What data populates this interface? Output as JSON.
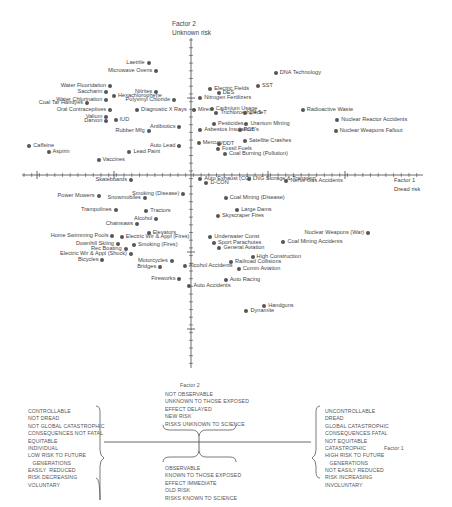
{
  "chart_data": {
    "type": "scatter",
    "title": "",
    "xlabel": "Factor 1 Dread risk",
    "ylabel": "Factor 2 Unknown risk",
    "grid": false,
    "axis_ranges": {
      "x": [
        -2.5,
        2.5
      ],
      "y": [
        -2.3,
        2.1
      ]
    },
    "legend_position": "bottom",
    "points": [
      {
        "label": "Laetrile",
        "x": -0.55,
        "y": 1.45,
        "side": "left"
      },
      {
        "label": "Microwave Ovens",
        "x": -0.45,
        "y": 1.35,
        "side": "left"
      },
      {
        "label": "Water Fluoridation",
        "x": -1.05,
        "y": 1.15,
        "side": "left"
      },
      {
        "label": "Saccharin",
        "x": -1.1,
        "y": 1.08,
        "side": "left"
      },
      {
        "label": "Water Chlorination",
        "x": -1.1,
        "y": 0.98,
        "side": "left"
      },
      {
        "label": "Coal Tar Hairdyes",
        "x": -1.35,
        "y": 0.93,
        "side": "left"
      },
      {
        "label": "Nitrites",
        "x": -0.45,
        "y": 1.08,
        "side": "left"
      },
      {
        "label": "Hexachlorophene",
        "x": -1.0,
        "y": 1.02,
        "side": "right"
      },
      {
        "label": "Polyvinyl Chloride",
        "x": -0.22,
        "y": 0.98,
        "side": "left"
      },
      {
        "label": "Oral Contraceptives",
        "x": -1.05,
        "y": 0.85,
        "side": "left"
      },
      {
        "label": "Diagnostic X Rays",
        "x": -0.7,
        "y": 0.85,
        "side": "right"
      },
      {
        "label": "Valium",
        "x": -1.1,
        "y": 0.75,
        "side": "left"
      },
      {
        "label": "Darvon",
        "x": -1.1,
        "y": 0.7,
        "side": "left"
      },
      {
        "label": "IUD",
        "x": -0.98,
        "y": 0.72,
        "side": "right"
      },
      {
        "label": "Antibiotics",
        "x": -0.15,
        "y": 0.62,
        "side": "left"
      },
      {
        "label": "Rubber Mfg",
        "x": -0.55,
        "y": 0.57,
        "side": "left"
      },
      {
        "label": "Caffeine",
        "x": -2.1,
        "y": 0.38,
        "side": "right"
      },
      {
        "label": "Aspirin",
        "x": -1.85,
        "y": 0.3,
        "side": "right"
      },
      {
        "label": "Auto Lead",
        "x": -0.15,
        "y": 0.38,
        "side": "left"
      },
      {
        "label": "Lead Paint",
        "x": -0.8,
        "y": 0.3,
        "side": "right"
      },
      {
        "label": "Vaccines",
        "x": -1.2,
        "y": 0.2,
        "side": "right"
      },
      {
        "label": "Mirex",
        "x": 0.04,
        "y": 0.84,
        "side": "right"
      },
      {
        "label": "Electric Fields",
        "x": 0.25,
        "y": 1.12,
        "side": "right"
      },
      {
        "label": "DES",
        "x": 0.36,
        "y": 1.06,
        "side": "right"
      },
      {
        "label": "Nitrogen Fertilizers",
        "x": 0.12,
        "y": 1.0,
        "side": "right"
      },
      {
        "label": "Cadmium Usage",
        "x": 0.27,
        "y": 0.86,
        "side": "right"
      },
      {
        "label": "Trichloroethylene",
        "x": 0.33,
        "y": 0.81,
        "side": "right"
      },
      {
        "label": "2,4,5-T",
        "x": 0.7,
        "y": 0.8,
        "side": "right"
      },
      {
        "label": "DNA Technology",
        "x": 1.1,
        "y": 1.33,
        "side": "right"
      },
      {
        "label": "SST",
        "x": 0.87,
        "y": 1.16,
        "side": "right"
      },
      {
        "label": "Radioactive Waste",
        "x": 1.45,
        "y": 0.85,
        "side": "right"
      },
      {
        "label": "Pesticides",
        "x": 0.3,
        "y": 0.66,
        "side": "right"
      },
      {
        "label": "Uranium Mining",
        "x": 0.72,
        "y": 0.66,
        "side": "right"
      },
      {
        "label": "Asbestos Insulation",
        "x": 0.12,
        "y": 0.58,
        "side": "right"
      },
      {
        "label": "PCB's",
        "x": 0.63,
        "y": 0.58,
        "side": "right"
      },
      {
        "label": "Nuclear Reactor Accidents",
        "x": 1.9,
        "y": 0.72,
        "side": "right"
      },
      {
        "label": "Nuclear Weapons Fallout",
        "x": 1.88,
        "y": 0.57,
        "side": "right"
      },
      {
        "label": "Satellite Crashes",
        "x": 0.7,
        "y": 0.44,
        "side": "right"
      },
      {
        "label": "Mercury",
        "x": 0.1,
        "y": 0.42,
        "side": "right"
      },
      {
        "label": "DDT",
        "x": 0.36,
        "y": 0.4,
        "side": "right"
      },
      {
        "label": "Fossil Fuels",
        "x": 0.35,
        "y": 0.34,
        "side": "right"
      },
      {
        "label": "Coal Burning (Pollution)",
        "x": 0.44,
        "y": 0.27,
        "side": "right"
      },
      {
        "label": "Skateboards",
        "x": -0.78,
        "y": -0.07,
        "side": "left"
      },
      {
        "label": "Power Mowers",
        "x": -1.2,
        "y": -0.27,
        "side": "left"
      },
      {
        "label": "Snowmobiles",
        "x": -0.6,
        "y": -0.3,
        "side": "left"
      },
      {
        "label": "Smoking (Disease)",
        "x": -0.1,
        "y": -0.25,
        "side": "left"
      },
      {
        "label": "Trampolines",
        "x": -0.98,
        "y": -0.45,
        "side": "left"
      },
      {
        "label": "Tractors",
        "x": -0.58,
        "y": -0.47,
        "side": "right"
      },
      {
        "label": "Alcohol",
        "x": -0.45,
        "y": -0.57,
        "side": "left"
      },
      {
        "label": "Chainsaws",
        "x": -0.7,
        "y": -0.63,
        "side": "left"
      },
      {
        "label": "Elevators",
        "x": -0.55,
        "y": -0.75,
        "side": "right"
      },
      {
        "label": "Home Swimming Pools",
        "x": -1.02,
        "y": -0.79,
        "side": "left"
      },
      {
        "label": "Electric Wir & Appl (Fires)",
        "x": -0.9,
        "y": -0.81,
        "side": "right"
      },
      {
        "label": "Downhill Skiing",
        "x": -0.95,
        "y": -0.89,
        "side": "left"
      },
      {
        "label": "Smoking (Fires)",
        "x": -0.74,
        "y": -0.91,
        "side": "right"
      },
      {
        "label": "Rec Boating",
        "x": -0.85,
        "y": -0.96,
        "side": "left"
      },
      {
        "label": "Electric Wir & Appl (Shock)",
        "x": -0.78,
        "y": -1.03,
        "side": "left"
      },
      {
        "label": "Bicycles",
        "x": -1.15,
        "y": -1.11,
        "side": "left"
      },
      {
        "label": "Motorcycles",
        "x": -0.25,
        "y": -1.12,
        "side": "left"
      },
      {
        "label": "Bridges",
        "x": -0.4,
        "y": -1.2,
        "side": "left"
      },
      {
        "label": "Fireworks",
        "x": -0.15,
        "y": -1.35,
        "side": "left"
      },
      {
        "label": "Auto Exhaust (CO)",
        "x": 0.12,
        "y": -0.05,
        "side": "right"
      },
      {
        "label": "D-CON",
        "x": 0.2,
        "y": -0.1,
        "side": "right"
      },
      {
        "label": "LNG Storage & Transport",
        "x": 0.75,
        "y": -0.05,
        "side": "right"
      },
      {
        "label": "Nerve Gas Accidents",
        "x": 1.24,
        "y": -0.08,
        "side": "right"
      },
      {
        "label": "Coal Mining (Disease)",
        "x": 0.45,
        "y": -0.3,
        "side": "right"
      },
      {
        "label": "Large Dams",
        "x": 0.6,
        "y": -0.46,
        "side": "right"
      },
      {
        "label": "Skyscraper Fires",
        "x": 0.35,
        "y": -0.53,
        "side": "right"
      },
      {
        "label": "Nuclear Weapons (War)",
        "x": 2.3,
        "y": -0.75,
        "side": "left"
      },
      {
        "label": "Underwater Const",
        "x": 0.25,
        "y": -0.81,
        "side": "right"
      },
      {
        "label": "Sport Parachutes",
        "x": 0.3,
        "y": -0.88,
        "side": "right"
      },
      {
        "label": "General Aviation",
        "x": 0.37,
        "y": -0.95,
        "side": "right"
      },
      {
        "label": "Coal Mining Accidents",
        "x": 1.2,
        "y": -0.87,
        "side": "right"
      },
      {
        "label": "High Construction",
        "x": 0.8,
        "y": -1.07,
        "side": "right"
      },
      {
        "label": "Railroad Collisions",
        "x": 0.52,
        "y": -1.13,
        "side": "right"
      },
      {
        "label": "Alcohol Accidents",
        "x": -0.08,
        "y": -1.18,
        "side": "right"
      },
      {
        "label": "Comm Aviation",
        "x": 0.62,
        "y": -1.22,
        "side": "right"
      },
      {
        "label": "Auto Racing",
        "x": 0.45,
        "y": -1.36,
        "side": "right"
      },
      {
        "label": "Auto Accidents",
        "x": -0.02,
        "y": -1.44,
        "side": "right"
      },
      {
        "label": "Handguns",
        "x": 0.95,
        "y": -1.7,
        "side": "right"
      },
      {
        "label": "Dynamite",
        "x": 0.72,
        "y": -1.77,
        "side": "right"
      }
    ],
    "annotations": {
      "factor1_axis_title": [
        "Factor 1",
        "Dread risk"
      ],
      "factor2_axis_title": [
        "Factor 2",
        "Unknown risk"
      ]
    }
  },
  "axes": {
    "y_title_line1": "Factor 2",
    "y_title_line2": "Unknown risk",
    "x_title_line1": "Factor 1",
    "x_title_line2": "Dread risk"
  },
  "legend": {
    "factor2_label": "Factor 2",
    "factor1_label": "Factor 1",
    "top_block": "NOT OBSERVABLE\nUNKNOWN TO THOSE EXPOSED\nEFFECT DELAYED\nNEW RISK\nRISKS UNKNOWN TO SCIENCE",
    "bottom_block": "OBSERVABLE\nKNOWN TO THOSE EXPOSED\nEFFECT IMMEDIATE\nOLD RISK\nRISKS KNOWN TO SCIENCE",
    "left_block": "CONTROLLABLE\nNOT DREAD\nNOT GLOBAL CATASTROPHIC\nCONSEQUENCES NOT FATAL\nEQUITABLE\nINDIVIDUAL\nLOW RISK TO FUTURE\n   GENERATIONS\nEASILY  REDUCED\nRISK DECREASING\nVOLUNTARY",
    "right_block": "UNCONTROLLABLE\nDREAD\nGLOBAL CATASTROPHIC\nCONSEQUENCES FATAL\nNOT EQUITABLE\nCATASTROPHIC\nHIGH RISK TO FUTURE\n   GENERATIONS\nNOT EASILY REDUCED\nRISK INCREASING\nINVOLUNTARY"
  },
  "style": {
    "dot_color": "#555555",
    "axis_color": "#444444",
    "text_color": "#444444"
  }
}
